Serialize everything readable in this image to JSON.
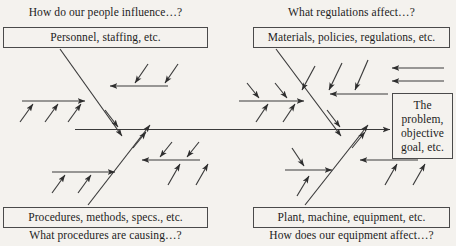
{
  "diagram": {
    "type": "fishbone-ishikawa",
    "title_label_style": "question-prompts",
    "colors": {
      "background": "#f4f2ee",
      "line": "#3a3a3a",
      "box_border": "#4a4a4a",
      "text": "#1c1c1c"
    },
    "effect_box": {
      "lines": [
        "The",
        "problem,",
        "objective",
        "goal, etc."
      ]
    },
    "categories": [
      {
        "id": "people",
        "position": "top-left",
        "box_label": "Personnel, staffing, etc.",
        "question_label": "How do our people influence…?"
      },
      {
        "id": "regulations",
        "position": "top-right",
        "box_label": "Materials, policies, regulations, etc.",
        "question_label": "What regulations affect…?"
      },
      {
        "id": "procedures",
        "position": "bottom-left",
        "box_label": "Procedures, methods, specs., etc.",
        "question_label": "What procedures are causing…?"
      },
      {
        "id": "equipment",
        "position": "bottom-right",
        "box_label": "Plant, machine, equipment, etc.",
        "question_label": "How does our equipment affect…?"
      }
    ]
  }
}
